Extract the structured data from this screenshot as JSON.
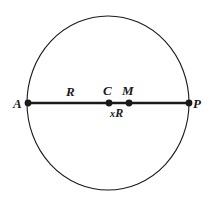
{
  "figure": {
    "kind": "geometry-diagram",
    "background_color": "#ffffff",
    "stroke_color": "#1a1a1a",
    "circle": {
      "center_x": 108,
      "center_y": 103,
      "radius_x": 81,
      "radius_y": 87,
      "stroke_width": 1
    },
    "chord": {
      "from_x": 28,
      "to_x": 189,
      "y": 103,
      "stroke_width": 2.2
    },
    "points": [
      {
        "id": "A",
        "label": "A",
        "x": 28,
        "y": 103,
        "dot_radius": 3.3
      },
      {
        "id": "C",
        "label": "C",
        "x": 109,
        "y": 103,
        "dot_radius": 3.3
      },
      {
        "id": "M",
        "label": "M",
        "x": 129,
        "y": 103,
        "dot_radius": 3.3
      },
      {
        "id": "P",
        "label": "P",
        "x": 189,
        "y": 103,
        "dot_radius": 3.3
      }
    ],
    "segment_labels": [
      {
        "id": "R",
        "label": "R",
        "position": "above-line",
        "between": "A-C"
      },
      {
        "id": "xR",
        "label": "xR",
        "position": "below-line",
        "between": "C-M"
      }
    ],
    "labels": {
      "A": "A",
      "P": "P",
      "C": "C",
      "M": "M",
      "R": "R",
      "xR_x": "x",
      "xR_R": "R"
    }
  }
}
